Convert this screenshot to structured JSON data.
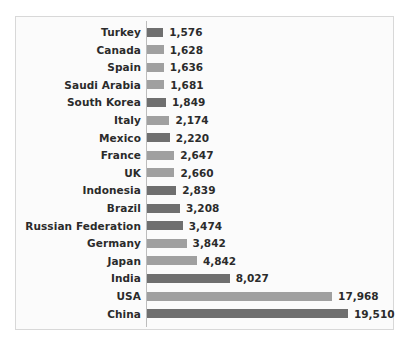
{
  "chart_data": {
    "type": "bar",
    "orientation": "horizontal",
    "title": "",
    "subtitle": "",
    "xlabel": "",
    "ylabel": "",
    "grid": false,
    "legend": null,
    "axis_line": true,
    "xlim": [
      0,
      19510
    ],
    "categories": [
      "Turkey",
      "Canada",
      "Spain",
      "Saudi Arabia",
      "South Korea",
      "Italy",
      "Mexico",
      "France",
      "UK",
      "Indonesia",
      "Brazil",
      "Russian Federation",
      "Germany",
      "Japan",
      "India",
      "USA",
      "China"
    ],
    "values": [
      1576,
      1628,
      1636,
      1681,
      1849,
      2174,
      2220,
      2647,
      2660,
      2839,
      3208,
      3474,
      3842,
      4842,
      8027,
      17968,
      19510
    ],
    "value_labels": [
      "1,576",
      "1,628",
      "1,636",
      "1,681",
      "1,849",
      "2,174",
      "2,220",
      "2,647",
      "2,660",
      "2,839",
      "3,208",
      "3,474",
      "3,842",
      "4,842",
      "8,027",
      "17,968",
      "19,510"
    ],
    "bar_shades": [
      "dark",
      "light",
      "light",
      "light",
      "dark",
      "light",
      "dark",
      "light",
      "light",
      "dark",
      "dark",
      "dark",
      "light",
      "light",
      "dark",
      "light",
      "dark"
    ],
    "colors": {
      "bar_dark": "#6f6f6f",
      "bar_light": "#a0a0a0",
      "label_text": "#2b2b2b",
      "axis_line": "#bdbdbd",
      "plot_background": "#fbfbfb",
      "frame_border": "#d8d8d8"
    }
  }
}
